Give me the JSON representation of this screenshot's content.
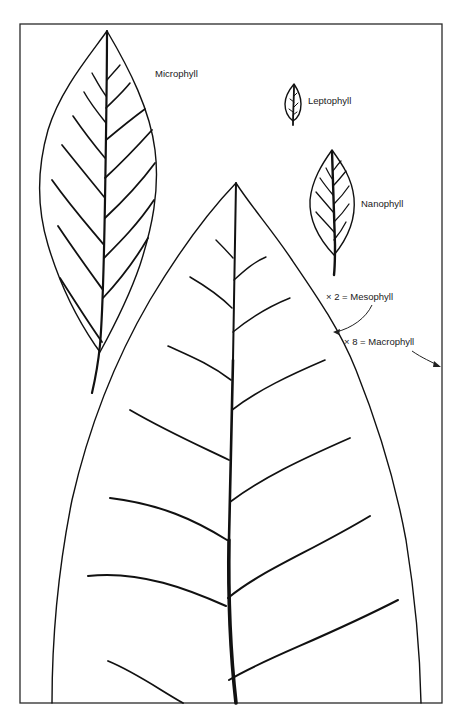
{
  "figure": {
    "frame": {
      "x": 20,
      "y": 24,
      "width": 422,
      "height": 679
    },
    "colors": {
      "ink": "#111111",
      "background": "#ffffff"
    },
    "leaves": [
      {
        "id": "microphyll",
        "label": "Microphyll"
      },
      {
        "id": "leptophyll",
        "label": "Leptophyll"
      },
      {
        "id": "nanophyll",
        "label": "Nanophyll"
      },
      {
        "id": "mesophyll-macrophyll",
        "label": "Large leaf (scaled)"
      }
    ],
    "labels": {
      "microphyll": "Microphyll",
      "leptophyll": "Leptophyll",
      "nanophyll": "Nanophyll",
      "mesophyll": "× 2 = Mesophyll",
      "macrophyll": "× 8 = Macrophyll"
    },
    "scale_notes": [
      {
        "multiplier": "× 2",
        "class": "Mesophyll",
        "points_to": "outline of large leaf"
      },
      {
        "multiplier": "× 8",
        "class": "Macrophyll",
        "points_to": "right edge of frame"
      }
    ]
  }
}
